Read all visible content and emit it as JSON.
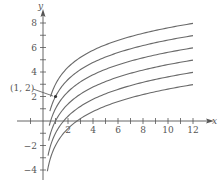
{
  "chart_data": {
    "type": "line",
    "title": "",
    "xlabel": "x",
    "ylabel": "y",
    "xlim": [
      -2,
      13
    ],
    "ylim": [
      -4.5,
      9
    ],
    "x_ticks": [
      -1,
      1,
      2,
      3,
      4,
      5,
      6,
      7,
      8,
      9,
      10,
      11,
      12
    ],
    "x_tick_labels": [
      "2",
      "4",
      "6",
      "8",
      "10",
      "12"
    ],
    "x_tick_label_values": [
      2,
      4,
      6,
      8,
      10,
      12
    ],
    "y_ticks": [
      -4,
      -3,
      -2,
      -1,
      1,
      2,
      3,
      4,
      5,
      6,
      7,
      8
    ],
    "y_tick_labels": [
      "8",
      "6",
      "4",
      "2",
      "−2",
      "−4"
    ],
    "y_tick_label_values": [
      8,
      6,
      4,
      2,
      -2,
      -4
    ],
    "grid": false,
    "legend": null,
    "family": "y = 2 ln x + C",
    "series": [
      {
        "name": "C=3",
        "C": 3,
        "x_start": 0.6,
        "x_end": 12,
        "points": [
          [
            1,
            3
          ],
          [
            2,
            4.39
          ],
          [
            4,
            5.77
          ],
          [
            6,
            6.58
          ],
          [
            8,
            7.16
          ],
          [
            10,
            7.61
          ],
          [
            12,
            7.97
          ]
        ]
      },
      {
        "name": "C=2",
        "C": 2,
        "x_start": 0.55,
        "x_end": 12,
        "points": [
          [
            1,
            2
          ],
          [
            2,
            3.39
          ],
          [
            4,
            4.77
          ],
          [
            6,
            5.58
          ],
          [
            8,
            6.16
          ],
          [
            10,
            6.61
          ],
          [
            12,
            6.97
          ]
        ]
      },
      {
        "name": "C=1",
        "C": 1,
        "x_start": 0.5,
        "x_end": 12,
        "points": [
          [
            1,
            1
          ],
          [
            2,
            2.39
          ],
          [
            4,
            3.77
          ],
          [
            6,
            4.58
          ],
          [
            8,
            5.16
          ],
          [
            10,
            5.61
          ],
          [
            12,
            5.97
          ]
        ]
      },
      {
        "name": "C=0",
        "C": 0,
        "x_start": 0.45,
        "x_end": 12,
        "points": [
          [
            1,
            0
          ],
          [
            2,
            1.39
          ],
          [
            4,
            2.77
          ],
          [
            6,
            3.58
          ],
          [
            8,
            4.16
          ],
          [
            10,
            4.61
          ],
          [
            12,
            4.97
          ]
        ]
      },
      {
        "name": "C=-1",
        "C": -1,
        "x_start": 0.4,
        "x_end": 12,
        "points": [
          [
            1,
            -1
          ],
          [
            2,
            0.39
          ],
          [
            4,
            1.77
          ],
          [
            6,
            2.58
          ],
          [
            8,
            3.16
          ],
          [
            10,
            3.61
          ],
          [
            12,
            3.97
          ]
        ]
      },
      {
        "name": "C=-2",
        "C": -2,
        "x_start": 0.35,
        "x_end": 12,
        "points": [
          [
            1,
            -2
          ],
          [
            2,
            -0.61
          ],
          [
            4,
            0.77
          ],
          [
            6,
            1.58
          ],
          [
            8,
            2.16
          ],
          [
            10,
            2.61
          ],
          [
            12,
            2.97
          ]
        ]
      }
    ],
    "annotations": [
      {
        "text": "(1, 2)",
        "point": [
          1,
          2
        ],
        "marker": "dot"
      }
    ]
  },
  "labels": {
    "x_axis": "x",
    "y_axis": "y",
    "point_label": "(1, 2)"
  },
  "colors": {
    "curve": "#6a6a6a",
    "axis": "#555555",
    "text": "#555555"
  }
}
